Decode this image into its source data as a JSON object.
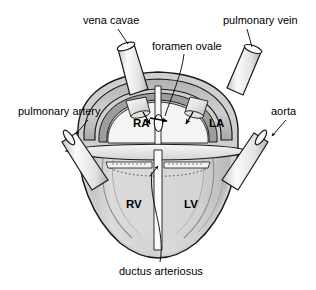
{
  "figure": {
    "background_color": "#ffffff",
    "line_color": "#000000",
    "labels": {
      "vena_cavae": "vena cavae",
      "pulmonary_vein": "pulmonary vein",
      "foramen_ovale": "foramen ovale",
      "pulmonary_artery": "pulmonary artery",
      "aorta": "aorta",
      "ductus_arteriosus": "ductus arteriosus"
    },
    "chambers": {
      "right_atrium": "RA",
      "left_atrium": "LA",
      "right_ventricle": "RV",
      "left_ventricle": "LV"
    },
    "colors": {
      "outer_wall": "#c9c9c9",
      "atrial_rim": "#9a9a9a",
      "ventricle_fill": "#d6d6d6",
      "ventricle_inner": "#c2c2c2",
      "chamber_light": "#f2f2f2",
      "vessel_light": "#efefef",
      "vessel_shade": "#bdbdbd",
      "valve_plane": "#e8e8e8",
      "foramen_white": "#ffffff",
      "outline": "#1a1a1a"
    }
  }
}
